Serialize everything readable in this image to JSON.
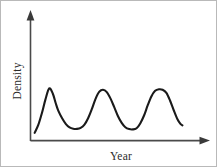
{
  "chart_data": {
    "type": "line",
    "title": "",
    "subtitle": "",
    "xlabel": "Year",
    "ylabel": "Density",
    "grid": false,
    "legend": false,
    "legend_position": "none",
    "axis_style": "arrow-headed open axes, no tick marks, no tick labels",
    "xlim": [
      0,
      1
    ],
    "ylim": [
      0,
      1
    ],
    "xticks": [],
    "yticks": [],
    "xticklabels": [],
    "yticklabels": [],
    "annotations": [],
    "series": [
      {
        "name": "Density",
        "color": "#1a1a1a",
        "linewidth": 2.1,
        "x": [
          0.019,
          0.041,
          0.063,
          0.084,
          0.107,
          0.129,
          0.146,
          0.163,
          0.185,
          0.208,
          0.23,
          0.252,
          0.275,
          0.297,
          0.32,
          0.342,
          0.365,
          0.387,
          0.41,
          0.432,
          0.455,
          0.477,
          0.5,
          0.522,
          0.545,
          0.567,
          0.59,
          0.612,
          0.635,
          0.657,
          0.68,
          0.702,
          0.725,
          0.747,
          0.77,
          0.792,
          0.815,
          0.837,
          0.86,
          0.882,
          0.9,
          0.912
        ],
        "y": [
          0.092,
          0.187,
          0.33,
          0.49,
          0.625,
          0.56,
          0.45,
          0.352,
          0.268,
          0.198,
          0.158,
          0.142,
          0.14,
          0.152,
          0.192,
          0.268,
          0.38,
          0.5,
          0.585,
          0.608,
          0.58,
          0.505,
          0.4,
          0.295,
          0.212,
          0.16,
          0.138,
          0.134,
          0.148,
          0.205,
          0.3,
          0.42,
          0.53,
          0.595,
          0.614,
          0.608,
          0.57,
          0.48,
          0.36,
          0.255,
          0.2,
          0.182
        ]
      }
    ],
    "cycle_features": {
      "peak_count": 3,
      "trough_count": 2,
      "peaks": [
        {
          "label": "peak 1",
          "x": 0.118,
          "y": 0.632,
          "shape": "steep rise, gentler fall"
        },
        {
          "label": "peak 2",
          "x": 0.443,
          "y": 0.61,
          "shape": "symmetric bell"
        },
        {
          "label": "peak 3",
          "x": 0.778,
          "y": 0.616,
          "shape": "flat rounded top, steep fall"
        }
      ],
      "troughs": [
        {
          "label": "trough 1",
          "x": 0.283,
          "y": 0.139
        },
        {
          "label": "trough 2",
          "x": 0.62,
          "y": 0.133
        }
      ],
      "start_point": {
        "x": 0.019,
        "y": 0.092
      },
      "end_point": {
        "x": 0.912,
        "y": 0.182
      }
    }
  },
  "figure": {
    "background_color": "#ffffff",
    "border_color": "#b9b9b9",
    "axis_color": "#4a4a4a",
    "curve_color": "#1a1a1a",
    "label_color": "#2b2b2b"
  }
}
